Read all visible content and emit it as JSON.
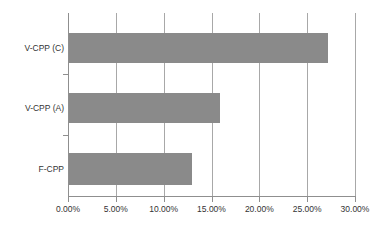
{
  "chart_data": {
    "type": "bar",
    "orientation": "horizontal",
    "title": "",
    "xlabel": "",
    "ylabel": "",
    "categories": [
      "V-CPP (C)",
      "V-CPP (A)",
      "F-CPP"
    ],
    "values": [
      27.2,
      15.9,
      13.0
    ],
    "value_format": "percent",
    "xlim": [
      0,
      30
    ],
    "xticks": [
      0,
      5,
      10,
      15,
      20,
      25,
      30
    ],
    "xtick_labels": [
      "0.00%",
      "5.00%",
      "10.00%",
      "15.00%",
      "20.00%",
      "25.00%",
      "30.00%"
    ],
    "grid": "vertical",
    "legend": "none",
    "bar_color": "#8a8a8a",
    "axis_color": "#8f8f8f",
    "gridline_color": "#a8a8a8",
    "background_color": "#ffffff",
    "series": [
      {
        "name": "",
        "values": [
          27.2,
          15.9,
          13.0
        ]
      }
    ]
  }
}
